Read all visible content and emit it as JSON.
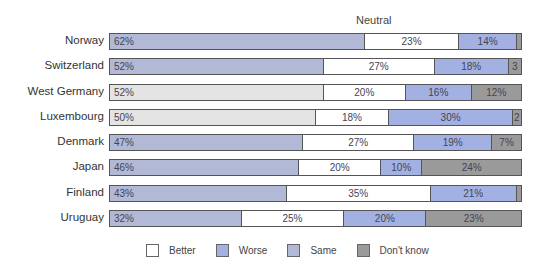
{
  "chart_data": {
    "type": "bar",
    "orientation": "horizontal",
    "stacked": true,
    "title": "",
    "annotation": "Neutral",
    "xlabel": "",
    "ylabel": "",
    "xlim": [
      0,
      100
    ],
    "grid": false,
    "legend_position": "bottom",
    "categories": [
      "Norway",
      "Switzerland",
      "West Germany",
      "Luxembourg",
      "Denmark",
      "Japan",
      "Finland",
      "Uruguay"
    ],
    "series": [
      {
        "name": "Same",
        "values": [
          62,
          52,
          52,
          50,
          47,
          46,
          43,
          32
        ]
      },
      {
        "name": "Better",
        "values": [
          23,
          27,
          20,
          18,
          27,
          20,
          35,
          25
        ]
      },
      {
        "name": "Worse",
        "values": [
          14,
          18,
          16,
          30,
          19,
          10,
          21,
          20
        ]
      },
      {
        "name": "Don't know",
        "values": [
          1,
          3,
          12,
          2,
          7,
          24,
          1,
          23
        ]
      }
    ]
  },
  "neutral_label": "Neutral",
  "colors": {
    "better": "#ffffff",
    "worse": "#a3b1e2",
    "same_blue": "#b1b9d6",
    "same_light": "#e4e4e4",
    "dont_know": "#9a9a9a"
  },
  "rows": [
    {
      "label": "Norway",
      "segments": [
        {
          "key": "same",
          "value": 62,
          "text": "62%",
          "color": "#b1b9d6"
        },
        {
          "key": "better",
          "value": 23,
          "text": "23%",
          "color": "#ffffff"
        },
        {
          "key": "worse",
          "value": 14,
          "text": "14%",
          "color": "#a3b1e2"
        },
        {
          "key": "dont_know",
          "value": 1,
          "text": "",
          "color": "#9a9a9a"
        }
      ]
    },
    {
      "label": "Switzerland",
      "segments": [
        {
          "key": "same",
          "value": 52,
          "text": "52%",
          "color": "#b1b9d6"
        },
        {
          "key": "better",
          "value": 27,
          "text": "27%",
          "color": "#ffffff"
        },
        {
          "key": "worse",
          "value": 18,
          "text": "18%",
          "color": "#a3b1e2"
        },
        {
          "key": "dont_know",
          "value": 3,
          "text": "3",
          "color": "#9a9a9a"
        }
      ]
    },
    {
      "label": "West Germany",
      "segments": [
        {
          "key": "same",
          "value": 52,
          "text": "52%",
          "color": "#e4e4e4"
        },
        {
          "key": "better",
          "value": 20,
          "text": "20%",
          "color": "#ffffff"
        },
        {
          "key": "worse",
          "value": 16,
          "text": "16%",
          "color": "#a3b1e2"
        },
        {
          "key": "dont_know",
          "value": 12,
          "text": "12%",
          "color": "#9a9a9a"
        }
      ]
    },
    {
      "label": "Luxembourg",
      "segments": [
        {
          "key": "same",
          "value": 50,
          "text": "50%",
          "color": "#e4e4e4"
        },
        {
          "key": "better",
          "value": 18,
          "text": "18%",
          "color": "#ffffff"
        },
        {
          "key": "worse",
          "value": 30,
          "text": "30%",
          "color": "#a3b1e2"
        },
        {
          "key": "dont_know",
          "value": 2,
          "text": "2",
          "color": "#9a9a9a"
        }
      ]
    },
    {
      "label": "Denmark",
      "segments": [
        {
          "key": "same",
          "value": 47,
          "text": "47%",
          "color": "#b1b9d6"
        },
        {
          "key": "better",
          "value": 27,
          "text": "27%",
          "color": "#ffffff"
        },
        {
          "key": "worse",
          "value": 19,
          "text": "19%",
          "color": "#a3b1e2"
        },
        {
          "key": "dont_know",
          "value": 7,
          "text": "7%",
          "color": "#9a9a9a"
        }
      ]
    },
    {
      "label": "Japan",
      "segments": [
        {
          "key": "same",
          "value": 46,
          "text": "46%",
          "color": "#b1b9d6"
        },
        {
          "key": "better",
          "value": 20,
          "text": "20%",
          "color": "#ffffff"
        },
        {
          "key": "worse",
          "value": 10,
          "text": "10%",
          "color": "#a3b1e2"
        },
        {
          "key": "dont_know",
          "value": 24,
          "text": "24%",
          "color": "#9a9a9a"
        }
      ]
    },
    {
      "label": "Finland",
      "segments": [
        {
          "key": "same",
          "value": 43,
          "text": "43%",
          "color": "#b1b9d6"
        },
        {
          "key": "better",
          "value": 35,
          "text": "35%",
          "color": "#ffffff"
        },
        {
          "key": "worse",
          "value": 21,
          "text": "21%",
          "color": "#a3b1e2"
        },
        {
          "key": "dont_know",
          "value": 1,
          "text": "",
          "color": "#9a9a9a"
        }
      ]
    },
    {
      "label": "Uruguay",
      "segments": [
        {
          "key": "same",
          "value": 32,
          "text": "32%",
          "color": "#b1b9d6"
        },
        {
          "key": "better",
          "value": 25,
          "text": "25%",
          "color": "#ffffff"
        },
        {
          "key": "worse",
          "value": 20,
          "text": "20%",
          "color": "#a3b1e2"
        },
        {
          "key": "dont_know",
          "value": 23,
          "text": "23%",
          "color": "#9a9a9a"
        }
      ]
    }
  ],
  "legend": [
    {
      "label": "Better",
      "color": "#ffffff"
    },
    {
      "label": "Worse",
      "color": "#a3b1e2"
    },
    {
      "label": "Same",
      "color": "#b1b9d6"
    },
    {
      "label": "Don't know",
      "color": "#9a9a9a"
    }
  ]
}
